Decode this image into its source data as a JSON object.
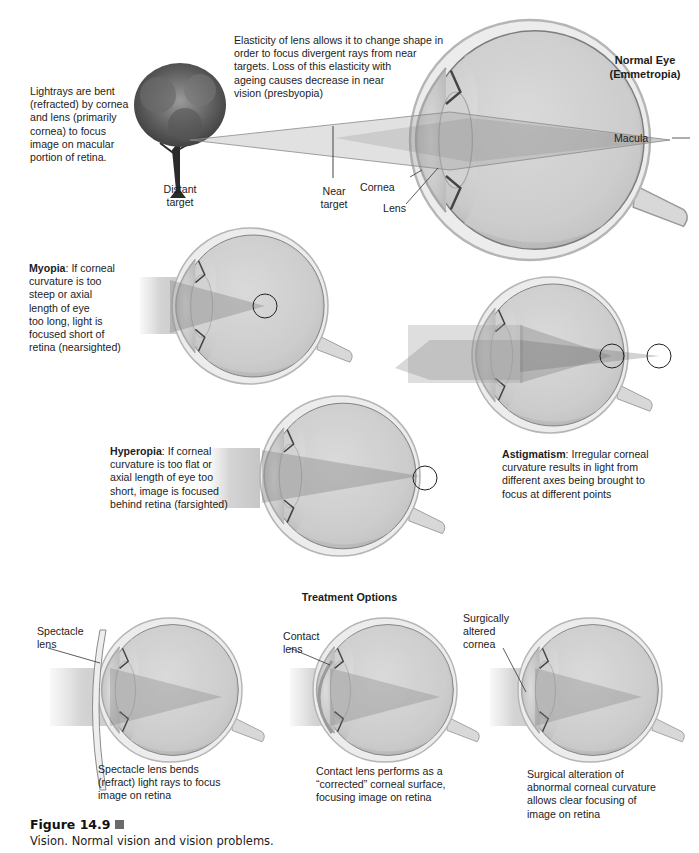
{
  "figure": {
    "number": "Figure 14.9",
    "caption": "Vision. Normal vision and vision problems."
  },
  "normal_eye": {
    "title_line1": "Normal Eye",
    "title_line2": "(Emmetropia)",
    "description_lines": [
      "Lightrays are bent",
      "(refracted) by cornea",
      "and lens (primarily",
      "cornea) to focus",
      "image on macular",
      "portion of retina."
    ],
    "elasticity_lines": [
      "Elasticity of lens allows it to change shape in",
      "order to focus divergent rays from near",
      "targets. Loss of this elasticity with",
      "ageing causes decrease in near",
      "vision (presbyopia)"
    ],
    "labels": {
      "distant_target_1": "Distant",
      "distant_target_2": "target",
      "near_target_1": "Near",
      "near_target_2": "target",
      "cornea": "Cornea",
      "lens": "Lens",
      "macula": "Macula"
    }
  },
  "myopia": {
    "term": "Myopia",
    "lines": [
      ": If corneal",
      "curvature is too",
      "steep or axial",
      "length of eye",
      "too long, light is",
      "focused short of",
      "retina (nearsighted)"
    ]
  },
  "hyperopia": {
    "term": "Hyperopia",
    "lines": [
      ": If corneal",
      "curvature is too flat or",
      "axial length of eye too",
      "short, image is focused",
      "behind retina (farsighted)"
    ]
  },
  "astigmatism": {
    "term": "Astigmatism",
    "lines": [
      ": Irregular corneal",
      "curvature results in light from",
      "different axes being brought to",
      "focus at different points"
    ]
  },
  "treatment": {
    "heading": "Treatment Options",
    "options": [
      {
        "label_lines": [
          "Spectacle",
          "lens"
        ],
        "caption_lines": [
          "Spectacle lens bends",
          "(refract) light rays to focus",
          "image on retina"
        ]
      },
      {
        "label_lines": [
          "Contact",
          "lens"
        ],
        "caption_lines": [
          "Contact lens performs as a",
          "“corrected” corneal surface,",
          "focusing image on retina"
        ]
      },
      {
        "label_lines": [
          "Surgically",
          "altered",
          "cornea"
        ],
        "caption_lines": [
          "Surgical alteration of",
          "abnormal corneal curvature",
          "allows clear focusing of",
          "image on retina"
        ]
      }
    ]
  },
  "colors": {
    "eye_fill": "#d4d4d4",
    "eye_outline": "#9a9a9a",
    "ray_fill": "#8a8a8a",
    "text": "#1c1c1c"
  }
}
